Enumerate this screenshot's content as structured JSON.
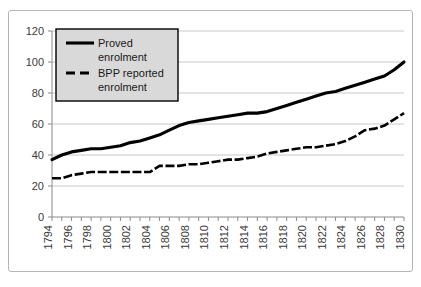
{
  "chart_data": {
    "type": "line",
    "title": "",
    "xlabel": "",
    "ylabel": "",
    "ylim": [
      0,
      120
    ],
    "ytick_step": 20,
    "yticks": [
      "0",
      "20",
      "40",
      "60",
      "80",
      "100",
      "120"
    ],
    "grid": true,
    "legend_position": "upper-left",
    "xlim": [
      1794,
      1830
    ],
    "x": [
      1794,
      1795,
      1796,
      1797,
      1798,
      1799,
      1800,
      1801,
      1802,
      1803,
      1804,
      1805,
      1806,
      1807,
      1808,
      1809,
      1810,
      1811,
      1812,
      1813,
      1814,
      1815,
      1816,
      1817,
      1818,
      1819,
      1820,
      1821,
      1822,
      1823,
      1824,
      1825,
      1826,
      1827,
      1828,
      1829,
      1830
    ],
    "xticks": [
      "1794",
      "1796",
      "1798",
      "1800",
      "1802",
      "1804",
      "1806",
      "1808",
      "1810",
      "1812",
      "1814",
      "1816",
      "1818",
      "1820",
      "1822",
      "1824",
      "1826",
      "1828",
      "1830"
    ],
    "xtick_step": 2,
    "minor_xticks_every": 1,
    "series": [
      {
        "name": "Proved enrolment",
        "style": "solid",
        "color": "#000000",
        "values": [
          37,
          40,
          42,
          43,
          44,
          44,
          45,
          46,
          48,
          49,
          51,
          53,
          56,
          59,
          61,
          62,
          63,
          64,
          65,
          66,
          67,
          67,
          68,
          70,
          72,
          74,
          76,
          78,
          80,
          81,
          83,
          85,
          87,
          89,
          91,
          95,
          100
        ]
      },
      {
        "name": "BPP reported enrolment",
        "style": "dashed",
        "color": "#000000",
        "values": [
          25,
          25,
          27,
          28,
          29,
          29,
          29,
          29,
          29,
          29,
          29,
          33,
          33,
          33,
          34,
          34,
          35,
          36,
          37,
          37,
          38,
          39,
          41,
          42,
          43,
          44,
          45,
          45,
          46,
          47,
          49,
          52,
          56,
          57,
          59,
          63,
          67
        ]
      }
    ]
  },
  "legend": {
    "entries": [
      {
        "label_line1": "Proved",
        "label_line2": "enrolment",
        "style": "solid"
      },
      {
        "label_line1": "BPP reported",
        "label_line2": "enrolment",
        "style": "dashed"
      }
    ]
  }
}
